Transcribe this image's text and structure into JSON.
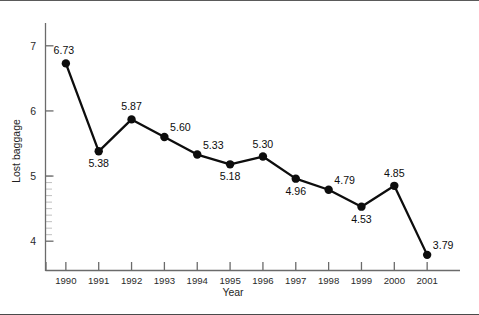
{
  "chart_data": {
    "type": "line",
    "title": "",
    "xlabel": "Year",
    "ylabel": "Lost baggage",
    "categories": [
      "1990",
      "1991",
      "1992",
      "1993",
      "1994",
      "1995",
      "1996",
      "1997",
      "1998",
      "1999",
      "2000",
      "2001"
    ],
    "values": [
      6.73,
      5.38,
      5.87,
      5.6,
      5.33,
      5.18,
      5.3,
      4.96,
      4.79,
      4.53,
      4.85,
      3.79
    ],
    "point_labels": [
      "6.73",
      "5.38",
      "5.87",
      "5.60",
      "5.33",
      "5.18",
      "5.30",
      "4.96",
      "4.79",
      "4.53",
      "4.85",
      "3.79"
    ],
    "label_positions": [
      "above-left",
      "below",
      "above",
      "above-right",
      "above-right",
      "below",
      "above",
      "below",
      "above-right",
      "below",
      "above",
      "above-right"
    ],
    "ytick_labels": [
      "7",
      "6",
      "5",
      "4"
    ],
    "ytick_values": [
      7,
      6,
      5,
      4
    ],
    "ylim": [
      3.55,
      7.35
    ],
    "xlim": [
      -0.62,
      12.0
    ],
    "grid": false,
    "legend": "none",
    "marker": "filled-circle",
    "line_color": "#0d0d0d",
    "marker_color": "#0d0d0d",
    "axis_color": "#6b6b6b",
    "background_color": "#ffffff"
  },
  "figure": {
    "border_color_top": "#5a5a5a",
    "border_color_bottom": "#4a4a4a"
  }
}
